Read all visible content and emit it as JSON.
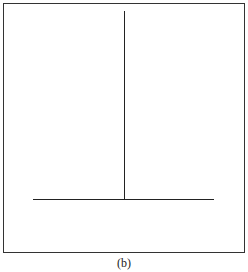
{
  "figure": {
    "caption": "(b)",
    "elements": [
      {
        "type": "frame",
        "desc": "rectangular border"
      },
      {
        "type": "vertical-line",
        "desc": "vertical stem from top to horizontal line"
      },
      {
        "type": "horizontal-line",
        "desc": "horizontal base line"
      }
    ],
    "line_color": "#222222"
  }
}
